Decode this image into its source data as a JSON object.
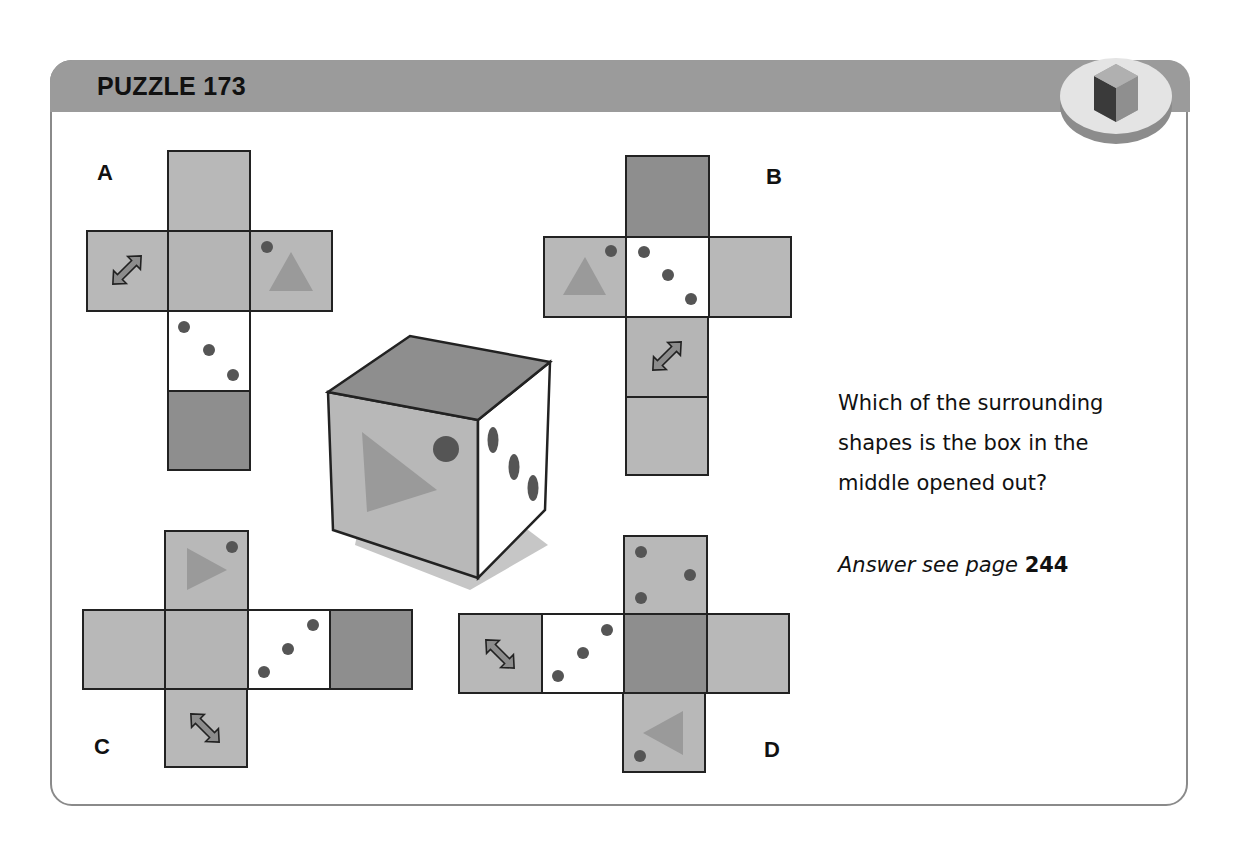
{
  "header": {
    "title": "PUZZLE 173",
    "badge_icon": "cube-icon"
  },
  "colors": {
    "header_bar": "#9b9b9b",
    "face_light": "#b8b8b8",
    "face_dark": "#8e8e8e",
    "face_white": "#ffffff",
    "dot": "#555555",
    "triangle": "#9a9a9a",
    "border": "#222222"
  },
  "options": [
    {
      "label": "A",
      "faces": [
        "plain-light",
        "arrow",
        "plain-light",
        "dot-triangle",
        "three-dots",
        "plain-dark"
      ]
    },
    {
      "label": "B",
      "faces": [
        "plain-dark",
        "triangle-dot",
        "three-dots",
        "plain-light",
        "arrow",
        "plain-light"
      ]
    },
    {
      "label": "C",
      "faces": [
        "triangle-dot",
        "plain-light",
        "plain-light",
        "three-dots",
        "plain-dark",
        "arrow"
      ]
    },
    {
      "label": "D",
      "faces": [
        "three-dots-variant",
        "arrow",
        "three-dots",
        "plain-dark",
        "plain-light",
        "triangle-dot"
      ]
    }
  ],
  "cube": {
    "top_face": "plain-dark",
    "front_face": "triangle-dot",
    "side_face": "three-dots"
  },
  "question": {
    "text": "Which of the surrounding shapes is the box in the middle opened out?",
    "answer_prefix": "Answer see page",
    "answer_page": "244"
  }
}
